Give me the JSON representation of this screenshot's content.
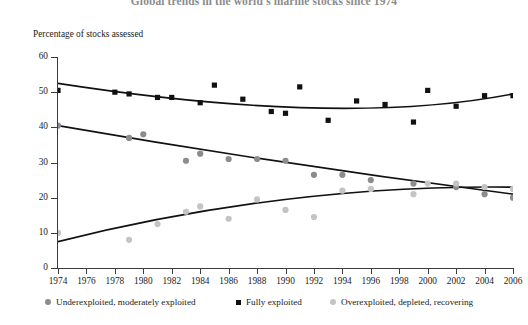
{
  "title": "Global trends in the world's marine stocks since 1974",
  "ylabel": "Percentage of stocks assessed",
  "axis": {
    "yticks": [
      "0",
      "10",
      "20",
      "30",
      "40",
      "50",
      "60"
    ],
    "xticks": [
      "1974",
      "1976",
      "1978",
      "1980",
      "1982",
      "1984",
      "1986",
      "1988",
      "1990",
      "1992",
      "1994",
      "1996",
      "1998",
      "2000",
      "2002",
      "2004",
      "2006"
    ]
  },
  "legend": {
    "items": [
      {
        "label": "Underexploited, moderately exploited",
        "marker": "circle",
        "color": "#8c8c8c"
      },
      {
        "label": "Fully exploited",
        "marker": "square",
        "color": "#111111"
      },
      {
        "label": "Overexploited, depleted, recovering",
        "marker": "circle",
        "color": "#c4c4c4"
      }
    ]
  },
  "chart_data": {
    "type": "scatter",
    "title": "Global trends in the world's marine stocks since 1974",
    "xlabel": "",
    "ylabel": "Percentage of stocks assessed",
    "xlim": [
      1974,
      2006
    ],
    "ylim": [
      0,
      60
    ],
    "grid": false,
    "legend_position": "bottom",
    "x": [
      1974,
      1978,
      1979,
      1980,
      1981,
      1983,
      1984,
      1985,
      1986,
      1987,
      1989,
      1990,
      1991,
      1992,
      1994,
      1995,
      1996,
      1997,
      1999,
      2000,
      2002,
      2004,
      2006
    ],
    "series": [
      {
        "name": "Underexploited, moderately exploited",
        "marker": "circle",
        "color": "#8c8c8c",
        "trend": "declining",
        "points": [
          {
            "x": 1974,
            "y": 40.5
          },
          {
            "x": 1979,
            "y": 37.0
          },
          {
            "x": 1980,
            "y": 38.0
          },
          {
            "x": 1983,
            "y": 30.5
          },
          {
            "x": 1984,
            "y": 32.5
          },
          {
            "x": 1986,
            "y": 31.0
          },
          {
            "x": 1988,
            "y": 31.0
          },
          {
            "x": 1990,
            "y": 30.5
          },
          {
            "x": 1992,
            "y": 26.5
          },
          {
            "x": 1994,
            "y": 26.5
          },
          {
            "x": 1996,
            "y": 25.0
          },
          {
            "x": 1999,
            "y": 24.0
          },
          {
            "x": 2002,
            "y": 23.0
          },
          {
            "x": 2004,
            "y": 21.0
          },
          {
            "x": 2006,
            "y": 20.0
          }
        ],
        "trendline": [
          {
            "x": 1974,
            "y": 40.5
          },
          {
            "x": 1990,
            "y": 30.0
          },
          {
            "x": 2006,
            "y": 21.0
          }
        ]
      },
      {
        "name": "Fully exploited",
        "marker": "square",
        "color": "#111111",
        "trend": "flat",
        "points": [
          {
            "x": 1974,
            "y": 50.5
          },
          {
            "x": 1978,
            "y": 50.0
          },
          {
            "x": 1979,
            "y": 49.5
          },
          {
            "x": 1981,
            "y": 48.5
          },
          {
            "x": 1982,
            "y": 48.5
          },
          {
            "x": 1984,
            "y": 47.0
          },
          {
            "x": 1985,
            "y": 52.0
          },
          {
            "x": 1987,
            "y": 48.0
          },
          {
            "x": 1989,
            "y": 44.5
          },
          {
            "x": 1990,
            "y": 44.0
          },
          {
            "x": 1991,
            "y": 51.5
          },
          {
            "x": 1993,
            "y": 42.0
          },
          {
            "x": 1995,
            "y": 47.5
          },
          {
            "x": 1997,
            "y": 46.5
          },
          {
            "x": 1999,
            "y": 41.5
          },
          {
            "x": 2000,
            "y": 50.5
          },
          {
            "x": 2002,
            "y": 46.0
          },
          {
            "x": 2004,
            "y": 49.0
          },
          {
            "x": 2006,
            "y": 49.0
          }
        ],
        "trendline": [
          {
            "x": 1974,
            "y": 52.5
          },
          {
            "x": 1992,
            "y": 45.5
          },
          {
            "x": 2006,
            "y": 49.5
          }
        ]
      },
      {
        "name": "Overexploited, depleted, recovering",
        "marker": "circle",
        "color": "#c4c4c4",
        "trend": "rising",
        "points": [
          {
            "x": 1974,
            "y": 10.0
          },
          {
            "x": 1979,
            "y": 8.0
          },
          {
            "x": 1981,
            "y": 12.5
          },
          {
            "x": 1983,
            "y": 16.0
          },
          {
            "x": 1984,
            "y": 17.5
          },
          {
            "x": 1986,
            "y": 14.0
          },
          {
            "x": 1988,
            "y": 19.5
          },
          {
            "x": 1990,
            "y": 16.5
          },
          {
            "x": 1992,
            "y": 14.5
          },
          {
            "x": 1994,
            "y": 22.0
          },
          {
            "x": 1996,
            "y": 22.5
          },
          {
            "x": 1999,
            "y": 21.0
          },
          {
            "x": 2000,
            "y": 24.0
          },
          {
            "x": 2002,
            "y": 24.0
          },
          {
            "x": 2004,
            "y": 23.0
          },
          {
            "x": 2006,
            "y": 22.5
          }
        ],
        "trendline": [
          {
            "x": 1974,
            "y": 7.5
          },
          {
            "x": 1990,
            "y": 19.5
          },
          {
            "x": 2006,
            "y": 23.0
          }
        ]
      }
    ]
  }
}
